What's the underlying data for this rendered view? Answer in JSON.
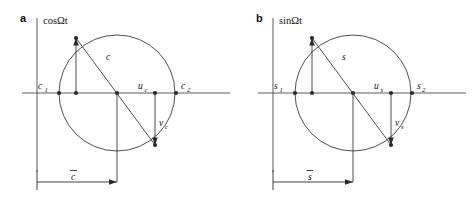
{
  "figure": {
    "background": "#ffffff",
    "line_color": "#3a3a3a",
    "text_color": "#111111",
    "dot_color": "#2b2b2b"
  },
  "panels": [
    {
      "letter": "a",
      "axis_label": "cosΩt",
      "labels": {
        "left_intercept": "c",
        "left_intercept_sub": "1",
        "right_intercept": "c",
        "right_intercept_sub": "2",
        "radius": "c",
        "u_main": "u",
        "u_sub": "c",
        "v_main": "v",
        "v_sub": "c",
        "dimension": "c",
        "dimension_overbar": "̄"
      }
    },
    {
      "letter": "b",
      "axis_label": "sinΩt",
      "labels": {
        "left_intercept": "s",
        "left_intercept_sub": "1",
        "right_intercept": "s",
        "right_intercept_sub": "2",
        "radius": "s",
        "u_main": "u",
        "u_sub": "s",
        "v_main": "v",
        "v_sub": "s",
        "dimension": "s",
        "dimension_overbar": "̄"
      }
    }
  ],
  "geometry": {
    "circle": {
      "cx": 117,
      "cy": 93,
      "r": 58
    },
    "vertical_axis": {
      "x": 37,
      "y_top": 18,
      "y_bottom": 172
    },
    "horizontal_axis": {
      "y": 93,
      "x_left": 22,
      "x_right": 228
    },
    "points": {
      "left_intercept": {
        "x": 59,
        "y": 93
      },
      "right_intercept": {
        "x": 176,
        "y": 93
      },
      "upper_circle": {
        "x": 76,
        "y": 38
      },
      "upper_foot": {
        "x": 76,
        "y": 93
      },
      "center": {
        "x": 117,
        "y": 93
      },
      "u_point": {
        "x": 155,
        "y": 93
      },
      "lower_circle": {
        "x": 155,
        "y": 145
      }
    },
    "dimension": {
      "y": 182,
      "x_start": 37,
      "x_end": 117
    }
  }
}
